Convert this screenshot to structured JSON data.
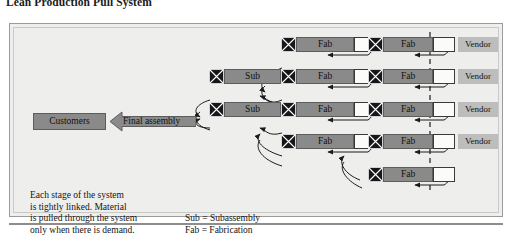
{
  "title": "Lean Production Pull System",
  "colors": {
    "panel_bg": "#eeeeec",
    "panel_border": "#9b9b9b",
    "process_fill": "#8a8a8a",
    "vendor_fill": "#bdbdbd",
    "buffer_fill": "#fbfbfa",
    "kanban_fill": "#15151a",
    "text": "#111111"
  },
  "customers": {
    "label": "Customers"
  },
  "final_assembly": {
    "label": "Final assembly"
  },
  "notes": {
    "description": "Each stage of the system\nis tightly linked. Material\nis pulled through the system\nonly when there is demand.",
    "legend": "Sub = Subassembly\nFab = Fabrication"
  },
  "rows": [
    {
      "id": "row-1",
      "stages": [
        {
          "type": "subassembly",
          "label": "Sub",
          "present": false
        },
        {
          "type": "fabrication",
          "label": "Fab",
          "present": true
        },
        {
          "type": "fabrication",
          "label": "Fab",
          "present": true
        }
      ],
      "vendor": {
        "label": "Vendor",
        "present": true
      }
    },
    {
      "id": "row-2",
      "stages": [
        {
          "type": "subassembly",
          "label": "Sub",
          "present": true
        },
        {
          "type": "fabrication",
          "label": "Fab",
          "present": true
        },
        {
          "type": "fabrication",
          "label": "Fab",
          "present": true
        }
      ],
      "vendor": {
        "label": "Vendor",
        "present": true
      }
    },
    {
      "id": "row-3",
      "stages": [
        {
          "type": "subassembly",
          "label": "Sub",
          "present": true
        },
        {
          "type": "fabrication",
          "label": "Fab",
          "present": true
        },
        {
          "type": "fabrication",
          "label": "Fab",
          "present": true
        }
      ],
      "vendor": {
        "label": "Vendor",
        "present": true
      }
    },
    {
      "id": "row-4",
      "stages": [
        {
          "type": "subassembly",
          "label": "Sub",
          "present": false
        },
        {
          "type": "fabrication",
          "label": "Fab",
          "present": true
        },
        {
          "type": "fabrication",
          "label": "Fab",
          "present": true
        }
      ],
      "vendor": {
        "label": "Vendor",
        "present": true
      }
    },
    {
      "id": "row-5",
      "stages": [
        {
          "type": "subassembly",
          "label": "Sub",
          "present": false
        },
        {
          "type": "fabrication",
          "label": "Fab",
          "present": false
        },
        {
          "type": "fabrication",
          "label": "Fab",
          "present": true
        }
      ],
      "vendor": {
        "label": "Vendor",
        "present": false
      }
    }
  ],
  "vendor_boundary": {
    "style": "dashed",
    "label": ""
  }
}
